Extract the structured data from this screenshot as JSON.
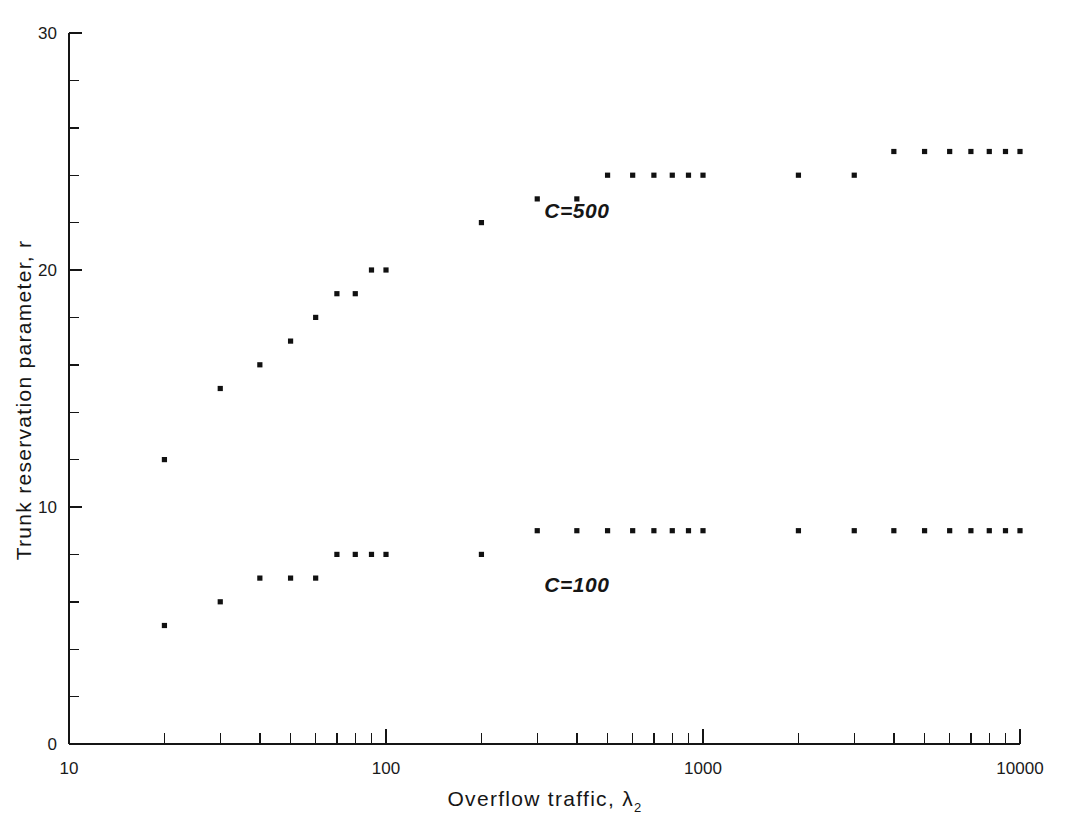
{
  "chart_data": {
    "type": "scatter",
    "title": "",
    "xlabel": "Overflow traffic, λ₂",
    "ylabel": "Trunk reservation parameter, r",
    "xscale": "log",
    "yscale": "linear",
    "xlim": [
      10,
      10000
    ],
    "ylim": [
      0,
      30
    ],
    "xticks": [
      10,
      100,
      1000,
      10000
    ],
    "xtick_labels": [
      "10",
      "100",
      "1000",
      "10000"
    ],
    "yticks": [
      0,
      2,
      4,
      6,
      8,
      10,
      12,
      14,
      16,
      18,
      20,
      22,
      24,
      26,
      28,
      30
    ],
    "ytick_labels_shown": [
      "0",
      "10",
      "20",
      "30"
    ],
    "ytick_labels_values": [
      0,
      10,
      20,
      30
    ],
    "grid": false,
    "legend_position": "inline-annotation",
    "marker": "square-dot",
    "marker_color": "#111111",
    "series": [
      {
        "name": "C=500",
        "annotation": "C=500",
        "annotation_x": 400,
        "annotation_y": 22.2,
        "points": [
          {
            "x": 20,
            "y": 12
          },
          {
            "x": 30,
            "y": 15
          },
          {
            "x": 40,
            "y": 16
          },
          {
            "x": 50,
            "y": 17
          },
          {
            "x": 60,
            "y": 18
          },
          {
            "x": 70,
            "y": 19
          },
          {
            "x": 80,
            "y": 19
          },
          {
            "x": 90,
            "y": 20
          },
          {
            "x": 100,
            "y": 20
          },
          {
            "x": 200,
            "y": 22
          },
          {
            "x": 300,
            "y": 23
          },
          {
            "x": 400,
            "y": 23
          },
          {
            "x": 500,
            "y": 24
          },
          {
            "x": 600,
            "y": 24
          },
          {
            "x": 700,
            "y": 24
          },
          {
            "x": 800,
            "y": 24
          },
          {
            "x": 900,
            "y": 24
          },
          {
            "x": 1000,
            "y": 24
          },
          {
            "x": 2000,
            "y": 24
          },
          {
            "x": 3000,
            "y": 24
          },
          {
            "x": 4000,
            "y": 25
          },
          {
            "x": 5000,
            "y": 25
          },
          {
            "x": 6000,
            "y": 25
          },
          {
            "x": 7000,
            "y": 25
          },
          {
            "x": 8000,
            "y": 25
          },
          {
            "x": 9000,
            "y": 25
          },
          {
            "x": 10000,
            "y": 25
          }
        ]
      },
      {
        "name": "C=100",
        "annotation": "C=100",
        "annotation_x": 400,
        "annotation_y": 6.4,
        "points": [
          {
            "x": 20,
            "y": 5
          },
          {
            "x": 30,
            "y": 6
          },
          {
            "x": 40,
            "y": 7
          },
          {
            "x": 50,
            "y": 7
          },
          {
            "x": 60,
            "y": 7
          },
          {
            "x": 70,
            "y": 8
          },
          {
            "x": 80,
            "y": 8
          },
          {
            "x": 90,
            "y": 8
          },
          {
            "x": 100,
            "y": 8
          },
          {
            "x": 200,
            "y": 8
          },
          {
            "x": 300,
            "y": 9
          },
          {
            "x": 400,
            "y": 9
          },
          {
            "x": 500,
            "y": 9
          },
          {
            "x": 600,
            "y": 9
          },
          {
            "x": 700,
            "y": 9
          },
          {
            "x": 800,
            "y": 9
          },
          {
            "x": 900,
            "y": 9
          },
          {
            "x": 1000,
            "y": 9
          },
          {
            "x": 2000,
            "y": 9
          },
          {
            "x": 3000,
            "y": 9
          },
          {
            "x": 4000,
            "y": 9
          },
          {
            "x": 5000,
            "y": 9
          },
          {
            "x": 6000,
            "y": 9
          },
          {
            "x": 7000,
            "y": 9
          },
          {
            "x": 8000,
            "y": 9
          },
          {
            "x": 9000,
            "y": 9
          },
          {
            "x": 10000,
            "y": 9
          }
        ]
      }
    ]
  },
  "axis": {
    "x_title_main": "Overflow traffic, λ",
    "x_title_sub": "2",
    "y_title": "Trunk reservation parameter, r"
  }
}
